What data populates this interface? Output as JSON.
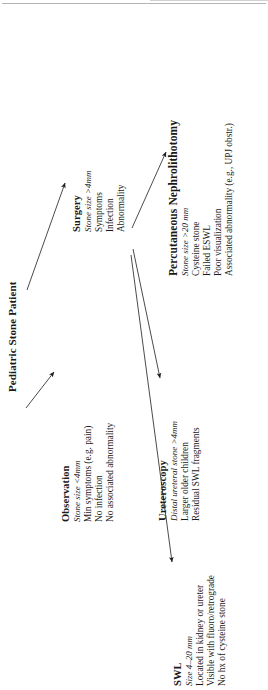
{
  "figure": {
    "orientation": "rotated-90-ccw",
    "background_color": "#ffffff",
    "text_color": "#1a1a1a",
    "line_color": "#2b2b2b"
  },
  "root": {
    "title": "Pediatric Stone Patient"
  },
  "nodes": [
    {
      "id": "observation",
      "title": "Observation",
      "subtitle": "Stone size <4mm",
      "items": [
        "Min symptoms (e.g. pain)",
        "No infection",
        "No associated abnormality"
      ]
    },
    {
      "id": "surgery",
      "title": "Surgery",
      "subtitle": "Stone size >4mm",
      "items": [
        "Symptoms",
        "Infection",
        "Abnormality"
      ]
    },
    {
      "id": "pcnl",
      "title": "Percutaneous Nephrolithotomy",
      "subtitle": "Stone size >20 mm",
      "items": [
        "Cysteine stone",
        "Failed ESWL",
        "Poor visualization",
        "Associated abnormality (e.g., UPJ obstr.)"
      ]
    },
    {
      "id": "ureteroscopy",
      "title": "Ureteroscopy",
      "subtitle": "Distal ureteral stone >4mm",
      "items": [
        "Larger older children",
        "Residual SWL fragments"
      ]
    },
    {
      "id": "swl",
      "title": "SWL",
      "subtitle": "Size 4–20 mm",
      "items": [
        "Located in kidney or ureter",
        "Visible with fluoro/retrograde",
        "No hx of cysteine stone"
      ]
    }
  ],
  "connectors": [
    {
      "id": "root-to-observation",
      "from": "Pediatric Stone Patient",
      "to": "Observation"
    },
    {
      "id": "root-to-surgery",
      "from": "Pediatric Stone Patient",
      "to": "Surgery"
    },
    {
      "id": "surgery-to-pcnl",
      "from": "Surgery",
      "to": "Percutaneous Nephrolithotomy"
    },
    {
      "id": "surgery-to-ureteroscopy",
      "from": "Surgery",
      "to": "Ureteroscopy"
    },
    {
      "id": "surgery-to-swl",
      "from": "Surgery",
      "to": "SWL"
    }
  ]
}
